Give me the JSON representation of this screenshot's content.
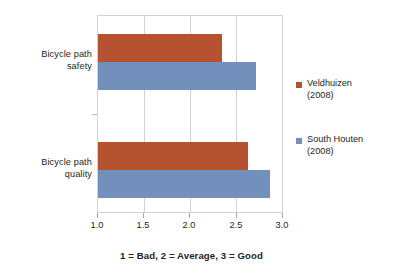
{
  "chart_data": {
    "type": "bar",
    "orientation": "horizontal",
    "title": "",
    "subtitle": "",
    "xlabel": "1 = Bad, 2 = Average, 3 = Good",
    "ylabel": "",
    "categories": [
      "Bicycle path safety",
      "Bicycle path quality"
    ],
    "series": [
      {
        "name": "Veldhuizen (2008)",
        "color": "#b5522f",
        "values": [
          2.35,
          2.63
        ]
      },
      {
        "name": "South Houten (2008)",
        "color": "#7390bd",
        "values": [
          2.72,
          2.87
        ]
      }
    ],
    "xlim": [
      1.0,
      3.0
    ],
    "xticks": [
      1.0,
      1.5,
      2.0,
      2.5,
      3.0
    ],
    "xtick_labels": [
      "1.0",
      "1.5",
      "2.0",
      "2.5",
      "3.0"
    ],
    "grid": "vertical-only",
    "legend_position": "right"
  },
  "categories": [
    {
      "line1": "Bicycle path",
      "line2": "safety"
    },
    {
      "line1": "Bicycle path",
      "line2": "quality"
    }
  ],
  "axis": {
    "tick_labels": [
      "1.0",
      "1.5",
      "2.0",
      "2.5",
      "3.0"
    ]
  },
  "legend": {
    "entries": [
      {
        "line1": "Veldhuizen",
        "line2": "(2008)",
        "color": "#b5522f"
      },
      {
        "line1": "South Houten",
        "line2": "(2008)",
        "color": "#7390bd"
      }
    ]
  },
  "caption": {
    "text": "1 = Bad, 2 = Average, 3 = Good"
  },
  "colors": {
    "series_0": "#b5522f",
    "series_1": "#7390bd",
    "grid": "#d2d2d2",
    "text": "#231f20",
    "background": "#ffffff"
  }
}
